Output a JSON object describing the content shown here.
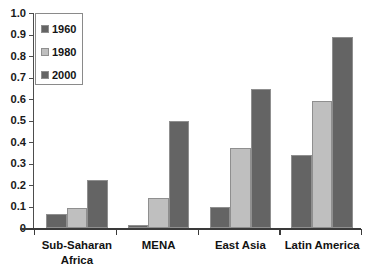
{
  "chart_data": {
    "type": "bar",
    "title": "",
    "subtitle": "",
    "xlabel": "",
    "ylabel": "",
    "categories": [
      "Sub-Saharan\nAfrica",
      "MENA",
      "East Asia",
      "Latin America"
    ],
    "series": [
      {
        "name": "1960",
        "color": "#646464",
        "values": [
          0.065,
          0.015,
          0.1,
          0.34
        ]
      },
      {
        "name": "1980",
        "color": "#bfbfbf",
        "values": [
          0.095,
          0.14,
          0.37,
          0.59
        ]
      },
      {
        "name": "2000",
        "color": "#646464",
        "values": [
          0.225,
          0.5,
          0.645,
          0.89
        ]
      }
    ],
    "ylim": [
      0,
      1.0
    ],
    "ytick_labels": [
      "0",
      "0.1",
      "0.2",
      "0.3",
      "0.4",
      "0.5",
      "0.6",
      "0.7",
      "0.8",
      "0.9",
      "1.0"
    ],
    "ytick_values": [
      0,
      0.1,
      0.2,
      0.3,
      0.4,
      0.5,
      0.6,
      0.7,
      0.8,
      0.9,
      1.0
    ],
    "grid": false,
    "legend_position": "top-left",
    "legend_entries": [
      "1960",
      "1980",
      "2000"
    ],
    "bar_border_color": "#8f8f8f",
    "axis_color": "#3a3a3a",
    "background_color": "#ffffff"
  }
}
